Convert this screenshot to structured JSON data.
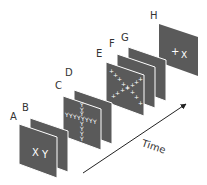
{
  "figure": {
    "panels": [
      {
        "id": "A",
        "label": "A",
        "stimulus": "X Y"
      },
      {
        "id": "B",
        "label": "B",
        "stimulus": ""
      },
      {
        "id": "C",
        "label": "C",
        "stimulus": "YYYYYYYY cross of Y"
      },
      {
        "id": "D",
        "label": "D",
        "stimulus": ""
      },
      {
        "id": "E",
        "label": "E",
        "stimulus": "X-shaped array of +"
      },
      {
        "id": "F",
        "label": "F",
        "stimulus": ""
      },
      {
        "id": "G",
        "label": "G",
        "stimulus": ""
      },
      {
        "id": "H",
        "label": "H",
        "stimulus": "+ X"
      }
    ],
    "labels": {
      "A": "A",
      "B": "B",
      "C": "C",
      "D": "D",
      "E": "E",
      "F": "F",
      "G": "G",
      "H": "H"
    },
    "stimuli": {
      "A_x": "X",
      "A_y": "Y",
      "H_plus": "+",
      "H_x": "X"
    },
    "axis": {
      "label": "Time"
    },
    "colors": {
      "panel_fill": "#5a5a5a",
      "panel_edge": "#ffffff",
      "stim_color": "#ffffff",
      "text": "#333333",
      "arrow": "#222222"
    }
  }
}
